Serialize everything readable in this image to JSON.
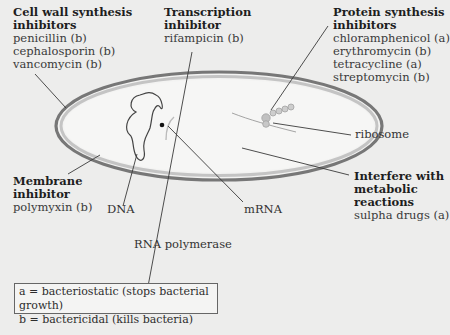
{
  "groups": {
    "cell_wall": {
      "heading": [
        "Cell wall synthesis",
        "inhibitors"
      ],
      "drugs": [
        "penicillin (b)",
        "cephalosporin (b)",
        "vancomycin (b)"
      ]
    },
    "transcription": {
      "heading": [
        "Transcription",
        "inhibitor"
      ],
      "drugs": [
        "rifampicin (b)"
      ]
    },
    "protein_synthesis": {
      "heading": [
        "Protein synthesis",
        "inhibitors"
      ],
      "drugs": [
        "chloramphenicol (a)",
        "erythromycin (b)",
        "tetracycline (a)",
        "streptomycin (b)"
      ]
    },
    "membrane": {
      "heading": [
        "Membrane",
        "inhibitor"
      ],
      "drugs": [
        "polymyxin (b)"
      ]
    },
    "metabolic": {
      "heading": [
        "Interfere with",
        "metabolic",
        "reactions"
      ],
      "drugs": [
        "sulpha drugs (a)"
      ]
    }
  },
  "structures": {
    "dna": "DNA",
    "rna_polymerase": "RNA polymerase",
    "mrna": "mRNA",
    "ribosome": "ribosome"
  },
  "legend": {
    "a": "a = bacteriostatic (stops bacterial growth)",
    "b": "b = bactericidal (kills bacteria)"
  },
  "colors": {
    "background": "#ededec",
    "cell_wall_outer": "#7d7d7d",
    "cell_wall_inner": "#b9b9b9",
    "cytoplasm": "#f3f3f2",
    "leader_line": "#3a3a3a",
    "ribosome": "#b3b3b3"
  }
}
